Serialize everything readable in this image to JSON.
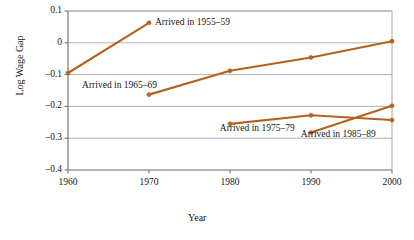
{
  "chart_data": {
    "type": "line",
    "title": "",
    "xlabel": "Year",
    "ylabel": "Log Wage Gap",
    "xlim": [
      1960,
      2000
    ],
    "ylim": [
      -0.4,
      0.1
    ],
    "xticks": [
      "1960",
      "1970",
      "1980",
      "1990",
      "2000"
    ],
    "yticks": [
      "0.1",
      "0",
      "–0.1",
      "–0.2",
      "–0.3",
      "–0.4"
    ],
    "ytick_values": [
      0.1,
      0,
      -0.1,
      -0.2,
      -0.3,
      -0.4
    ],
    "xtick_values": [
      1960,
      1970,
      1980,
      1990,
      2000
    ],
    "grid": true,
    "grid_axis": "y",
    "legend": "inline-annotations",
    "series_color": "#b4631f",
    "series": [
      {
        "name": "Arrived in 1955–59",
        "label": "Arrived in 1955–59",
        "x": [
          1960,
          1970
        ],
        "values": [
          -0.095,
          0.063
        ]
      },
      {
        "name": "Arrived in 1965–69",
        "label": "Arrived in 1965–69",
        "x": [
          1970,
          1980,
          1990,
          2000
        ],
        "values": [
          -0.163,
          -0.088,
          -0.046,
          0.005
        ]
      },
      {
        "name": "Arrived in 1975–79",
        "label": "Arrived in 1975–79",
        "x": [
          1980,
          1990,
          2000
        ],
        "values": [
          -0.255,
          -0.228,
          -0.243
        ]
      },
      {
        "name": "Arrived in 1985–89",
        "label": "Arrived in 1985–89",
        "x": [
          1990,
          2000
        ],
        "values": [
          -0.282,
          -0.198
        ]
      }
    ],
    "annotations": [
      {
        "text": "Arrived in 1955–59",
        "x": 1970,
        "y": 0.063
      },
      {
        "text": "Arrived in 1965–69",
        "x": 1961,
        "y": -0.135
      },
      {
        "text": "Arrived in 1975–79",
        "x": 1978,
        "y": -0.272
      },
      {
        "text": "Arrived in 1985–89",
        "x": 1988,
        "y": -0.29
      }
    ]
  },
  "colors": {
    "line": "#b4631f",
    "marker": "#b4631f",
    "grid": "#a8a8a8",
    "axis": "#6b6b6b",
    "text": "#151515",
    "background": "#ffffff"
  }
}
